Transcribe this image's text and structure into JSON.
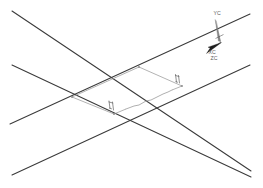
{
  "drawing": {
    "type": "isometric-line-drawing",
    "canvas": {
      "width": 263,
      "height": 188,
      "background": "#ffffff"
    },
    "colors": {
      "primary_line": "#3a3a3a",
      "secondary_line": "#9a9a9a",
      "marker": "#6b6b6b",
      "axis_arrow": "#1c1c1c",
      "axis_needle": "#707070",
      "label_text": "#5a5a5a"
    },
    "long_lines": [
      {
        "name": "upper-left-descending-line",
        "x1": 12,
        "y1": 11,
        "x2": 251,
        "y2": 171
      },
      {
        "name": "lower-left-descending-line",
        "x1": 12,
        "y1": 65,
        "x2": 251,
        "y2": 177
      },
      {
        "name": "upper-right-ascending-line",
        "x1": 250,
        "y1": 14,
        "x2": 10,
        "y2": 124
      },
      {
        "name": "lower-right-ascending-line",
        "x1": 250,
        "y1": 65,
        "x2": 12,
        "y2": 175
      }
    ],
    "parallelogram": {
      "name": "center-parallelogram",
      "vertices": [
        {
          "name": "top-vertex",
          "x": 139,
          "y": 67
        },
        {
          "name": "right-vertex",
          "x": 182,
          "y": 86
        },
        {
          "name": "bottom-vertex",
          "x": 114,
          "y": 114
        },
        {
          "name": "left-vertex",
          "x": 72,
          "y": 97
        }
      ]
    },
    "dimension_markers": [
      {
        "name": "right-vertex-tick-marker",
        "x": 177,
        "y": 78
      },
      {
        "name": "bottom-vertex-tick-marker",
        "x": 111,
        "y": 105
      }
    ],
    "wavy_segment": {
      "name": "irregular-edge-segment",
      "from": {
        "x": 131,
        "y": 104
      },
      "to": {
        "x": 168,
        "y": 92
      }
    }
  },
  "axis_indicator": {
    "name": "coordinate-axis-triad",
    "labels": {
      "y_axis": "YC",
      "x_axis": "XC",
      "z_axis": "ZC"
    },
    "origin": {
      "x": 219,
      "y": 36
    },
    "y_label_position": {
      "x": 214,
      "y": 13
    },
    "x_label_position": {
      "x": 209,
      "y": 52
    },
    "z_label_position": {
      "x": 212,
      "y": 59
    }
  }
}
